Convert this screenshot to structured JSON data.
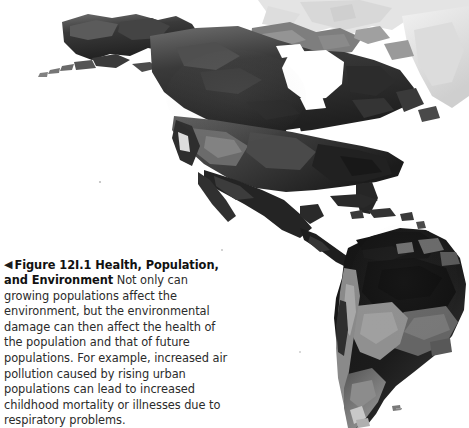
{
  "figure": {
    "marker_icon": "left-triangle-icon",
    "marker_glyph": "◀",
    "label": "Figure 12I.1",
    "title": "Health, Population, and Environment",
    "body": "Not only can growing populations affect the environment, but the environmental damage can then affect the health of the population and that of future populations. For example, increased air pollution caused by rising urban populations can lead to increased childhood mortality or illnesses due to respiratory problems."
  },
  "map": {
    "alt": "Grayscale satellite terrain map of the Americas",
    "regions": [
      "Alaska",
      "Canada",
      "Greenland",
      "United States",
      "Mexico",
      "Central America",
      "Caribbean",
      "South America",
      "Amazon Basin",
      "Andes",
      "Patagonia"
    ],
    "colors": {
      "background": "#ffffff",
      "ocean": "#ffffff",
      "land_dark": "#1f1f1f",
      "land_mid": "#4a4a4a",
      "land_light": "#8e8e8e",
      "ice": "#e9e9e9"
    }
  }
}
